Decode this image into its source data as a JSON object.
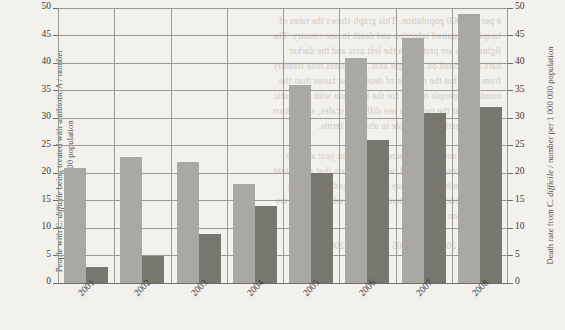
{
  "chart_data": {
    "type": "bar",
    "title": "",
    "categories": [
      "2001",
      "2002",
      "2003",
      "2004",
      "2005",
      "2006",
      "2007",
      "2008"
    ],
    "series": [
      {
        "name": "People with C. difficile being treated with antibiotic A / number per 100 000 population",
        "axis": "left",
        "color": "#a9a8a3",
        "values": [
          21,
          23,
          22,
          18,
          36,
          41,
          44.5,
          49
        ]
      },
      {
        "name": "Death rate from C. difficile / number per 1 000 000 population",
        "axis": "right",
        "color": "#77766f",
        "values": [
          3,
          5,
          9,
          14,
          20,
          26,
          31,
          32
        ]
      }
    ],
    "xlabel": "",
    "ylabel_left_parts": {
      "a": "People with C. ",
      "italic": "difficile",
      "b": " being treated with antibiotic A / number",
      "c": "per 100 000 population"
    },
    "ylabel_right_parts": {
      "a": "Death rate from C. ",
      "italic": "difficile",
      "b": " / number per 1 000 000 population"
    },
    "ylim": [
      0,
      50
    ],
    "ylim_right": [
      0,
      50
    ],
    "yticks": [
      0,
      5,
      10,
      15,
      20,
      25,
      30,
      35,
      40,
      45,
      50
    ],
    "grid": true,
    "legend": "none"
  },
  "bleed_text": "e per 100 000 population. This graph shows the rates of\nhospital-acquired infection and death in one country. The\nlighter bars are plotted on the left axis and the darker\nbars are plotted on the right axis. Both rates rose steadily\nfrom 2001 but the number of deaths rose faster than the\nnumber of people treated for the infection with antibiotic\nA. Note that the two axes use different scales, so the bars\nare not directly comparable in absolute terms.\n\nThe use of antibiotic A increased year on year and the\ndeath rate rose in parallel, which suggests that a resistant\nstrain of the bacterium may have emerged during this\nperiod. Public health measures introduced after 2008 are\nnot shown on this graph.\n\n2001 2002 2003 2004 2005 2006 2007 2008"
}
